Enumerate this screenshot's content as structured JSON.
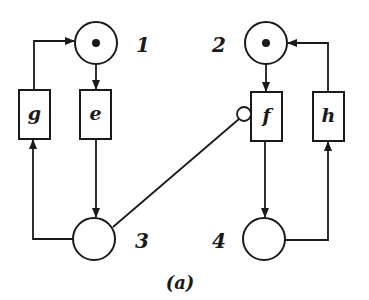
{
  "diagram": {
    "type": "petri-net",
    "caption": "(a)",
    "places": [
      {
        "id": "1",
        "label": "1",
        "tokens": 1
      },
      {
        "id": "2",
        "label": "2",
        "tokens": 1
      },
      {
        "id": "3",
        "label": "3",
        "tokens": 0
      },
      {
        "id": "4",
        "label": "4",
        "tokens": 0
      }
    ],
    "transitions": [
      {
        "id": "g",
        "label": "g"
      },
      {
        "id": "e",
        "label": "e"
      },
      {
        "id": "f",
        "label": "f"
      },
      {
        "id": "h",
        "label": "h"
      }
    ],
    "arcs": [
      {
        "from": "1",
        "to": "e",
        "kind": "normal"
      },
      {
        "from": "e",
        "to": "3",
        "kind": "normal"
      },
      {
        "from": "3",
        "to": "g",
        "kind": "normal"
      },
      {
        "from": "g",
        "to": "1",
        "kind": "normal"
      },
      {
        "from": "2",
        "to": "f",
        "kind": "normal"
      },
      {
        "from": "f",
        "to": "4",
        "kind": "normal"
      },
      {
        "from": "4",
        "to": "h",
        "kind": "normal"
      },
      {
        "from": "h",
        "to": "2",
        "kind": "normal"
      },
      {
        "from": "3",
        "to": "f",
        "kind": "inhibitor"
      }
    ],
    "colors": {
      "stroke": "#1a1a1a",
      "background": "#ffffff"
    }
  }
}
